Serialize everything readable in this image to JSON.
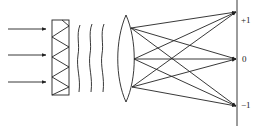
{
  "diagram": {
    "type": "optics-diffraction",
    "elements": [
      "incident-rays",
      "diffraction-grating",
      "wavefronts",
      "convex-lens",
      "screen"
    ],
    "incident_rays": 3,
    "wavefronts": 3,
    "orders": [
      {
        "label": "+1",
        "y": 12
      },
      {
        "label": "0",
        "y": 59
      },
      {
        "label": "−1",
        "y": 106
      }
    ],
    "stroke_color": "#222222"
  }
}
